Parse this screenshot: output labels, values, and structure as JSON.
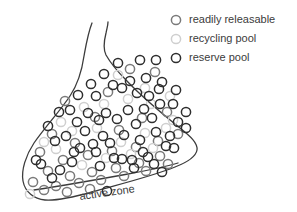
{
  "figure": {
    "background_color": "#ffffff",
    "outline_color": "#3c3c3c",
    "text_color": "#3b3b3b"
  },
  "legend": {
    "position": "top-right",
    "items": [
      {
        "key": "readily_releasable",
        "label": "readily releasable",
        "marker_icon": "open-circle-icon",
        "color": "#7a7a7a",
        "marker_cx": 176,
        "marker_cy": 20,
        "marker_r": 4.6,
        "label_x": 189,
        "label_y": 20
      },
      {
        "key": "recycling_pool",
        "label": "recycling pool",
        "marker_icon": "open-circle-icon",
        "color": "#cfcfcf",
        "marker_cx": 176,
        "marker_cy": 39,
        "marker_r": 4.6,
        "label_x": 189,
        "label_y": 39
      },
      {
        "key": "reserve_pool",
        "label": "reserve pool",
        "marker_icon": "open-circle-icon",
        "color": "#2e2e2e",
        "marker_cx": 176,
        "marker_cy": 58,
        "marker_r": 4.6,
        "label_x": 189,
        "label_y": 58
      }
    ]
  },
  "annotations": {
    "active_zone": {
      "label": "active zone",
      "x": 80,
      "y": 200,
      "rotation_deg": -8
    }
  },
  "terminal": {
    "outline_path": "M 92 23 C 88 33 86 45 84 56 C 82 70 78 84 70 96 C 60 111 46 126 34 143 C 26 155 21 170 23 181 C 25 192 34 199 45 200 C 58 201 74 197 92 192 C 120 184 150 177 175 167 C 188 162 196 156 197 150 C 198 143 190 136 180 128 C 160 112 140 95 126 80 C 116 70 110 62 106 55 C 103 49 104 41 106 33 C 107 28 108 25 108 22",
    "neck_left_path": "M 92 23 C 88 33 86 45 84 56 C 82 70 78 84 70 96",
    "active_zone_path": "M 34 190 C 60 186 95 180 128 174 C 150 170 168 166 178 163"
  },
  "chart_data": {
    "type": "scatter",
    "xlabel": "",
    "ylabel": "",
    "grid": false,
    "legend_position": "top-right",
    "pool_counts": {
      "readily_releasable": 33,
      "recycling_pool": 21,
      "reserve_pool": 63,
      "total": 117
    },
    "series": [
      {
        "name": "readily releasable",
        "color": "#7a7a7a",
        "radius": 4.6,
        "points": [
          [
            65,
            101
          ],
          [
            108,
            92
          ],
          [
            130,
            69
          ],
          [
            155,
            72
          ],
          [
            95,
            117
          ],
          [
            52,
            134
          ],
          [
            75,
            143
          ],
          [
            119,
            130
          ],
          [
            142,
            118
          ],
          [
            167,
            112
          ],
          [
            40,
            152
          ],
          [
            63,
            160
          ],
          [
            88,
            155
          ],
          [
            112,
            151
          ],
          [
            136,
            147
          ],
          [
            158,
            141
          ],
          [
            178,
            134
          ],
          [
            48,
            171
          ],
          [
            70,
            176
          ],
          [
            92,
            172
          ],
          [
            116,
            168
          ],
          [
            139,
            163
          ],
          [
            160,
            156
          ],
          [
            33,
            182
          ],
          [
            56,
            186
          ],
          [
            79,
            183
          ],
          [
            101,
            180
          ],
          [
            124,
            176
          ],
          [
            146,
            171
          ],
          [
            168,
            164
          ],
          [
            44,
            190
          ],
          [
            67,
            192
          ],
          [
            90,
            189
          ]
        ]
      },
      {
        "name": "recycling pool",
        "color": "#cfcfcf",
        "radius": 4.6,
        "points": [
          [
            118,
            75
          ],
          [
            145,
            88
          ],
          [
            170,
            96
          ],
          [
            84,
            107
          ],
          [
            61,
            122
          ],
          [
            104,
            104
          ],
          [
            128,
            99
          ],
          [
            151,
            104
          ],
          [
            173,
            120
          ],
          [
            44,
            142
          ],
          [
            72,
            131
          ],
          [
            97,
            128
          ],
          [
            121,
            142
          ],
          [
            145,
            133
          ],
          [
            166,
            128
          ],
          [
            56,
            149
          ],
          [
            82,
            165
          ],
          [
            106,
            158
          ],
          [
            131,
            154
          ],
          [
            153,
            148
          ],
          [
            30,
            194
          ]
        ]
      },
      {
        "name": "reserve pool",
        "color": "#2e2e2e",
        "radius": 4.6,
        "points": [
          [
            118,
            63
          ],
          [
            140,
            60
          ],
          [
            156,
            60
          ],
          [
            104,
            74
          ],
          [
            130,
            81
          ],
          [
            146,
            78
          ],
          [
            162,
            82
          ],
          [
            176,
            90
          ],
          [
            91,
            84
          ],
          [
            113,
            85
          ],
          [
            137,
            93
          ],
          [
            159,
            89
          ],
          [
            173,
            104
          ],
          [
            78,
            95
          ],
          [
            96,
            96
          ],
          [
            122,
            88
          ],
          [
            149,
            96
          ],
          [
            186,
            112
          ],
          [
            70,
            110
          ],
          [
            88,
            113
          ],
          [
            106,
            113
          ],
          [
            128,
            110
          ],
          [
            144,
            109
          ],
          [
            160,
            104
          ],
          [
            178,
            122
          ],
          [
            59,
            112
          ],
          [
            77,
            122
          ],
          [
            99,
            120
          ],
          [
            117,
            119
          ],
          [
            136,
            124
          ],
          [
            152,
            118
          ],
          [
            170,
            136
          ],
          [
            186,
            128
          ],
          [
            48,
            126
          ],
          [
            66,
            136
          ],
          [
            85,
            131
          ],
          [
            103,
            136
          ],
          [
            124,
            135
          ],
          [
            140,
            140
          ],
          [
            156,
            132
          ],
          [
            174,
            148
          ],
          [
            36,
            160
          ],
          [
            55,
            141
          ],
          [
            74,
            152
          ],
          [
            93,
            144
          ],
          [
            110,
            143
          ],
          [
            132,
            160
          ],
          [
            148,
            157
          ],
          [
            166,
            146
          ],
          [
            41,
            164
          ],
          [
            60,
            170
          ],
          [
            80,
            148
          ],
          [
            100,
            166
          ],
          [
            122,
            159
          ],
          [
            143,
            152
          ],
          [
            162,
            172
          ],
          [
            52,
            178
          ],
          [
            72,
            162
          ],
          [
            96,
            152
          ],
          [
            114,
            158
          ],
          [
            134,
            168
          ],
          [
            154,
            164
          ],
          [
            107,
            191
          ]
        ]
      }
    ]
  }
}
